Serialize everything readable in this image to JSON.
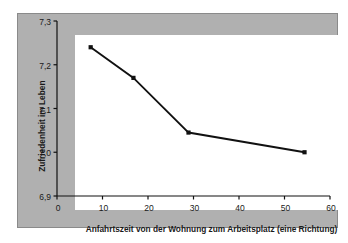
{
  "chart_data": {
    "type": "line",
    "title": "",
    "xlabel": "Anfahrtszeit von der Wohnung zum Arbeitsplatz (eine Richtung)",
    "ylabel": "Zufriedenheit im Leben",
    "xlim": [
      0,
      60
    ],
    "ylim": [
      6.9,
      7.3
    ],
    "xticks": [
      0,
      10,
      20,
      30,
      40,
      50,
      60
    ],
    "xtick_labels": [
      "0",
      "10",
      "20",
      "30",
      "40",
      "50",
      "60"
    ],
    "yticks": [
      6.9,
      7.0,
      7.1,
      7.2,
      7.3
    ],
    "ytick_labels": [
      "6,9",
      "7,0",
      "7,1",
      "7,2",
      "7,3"
    ],
    "grid": false,
    "legend": null,
    "series": [
      {
        "name": "Zufriedenheit im Leben",
        "marker": "square",
        "color": "#111111",
        "x": [
          7.4,
          16.8,
          28.9,
          54.4
        ],
        "y": [
          7.24,
          7.17,
          7.045,
          7.0
        ]
      }
    ]
  },
  "style": {
    "panel_color": "#b0b0b0",
    "panel_border_color": "#8a8a8a",
    "plot_background": "#ffffff",
    "axis_color": "#111111",
    "line_color": "#111111",
    "text_color": "#1a1a1a"
  }
}
